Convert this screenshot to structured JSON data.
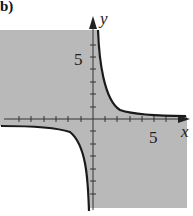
{
  "panel_label": "b)",
  "axes": {
    "x_label": "x",
    "y_label": "y",
    "x_tick_label": "5",
    "y_tick_label": "5"
  },
  "colors": {
    "shade": "#b9b9b9",
    "curve": "#1a1a1a",
    "axis": "#333333",
    "background": "#ffffff"
  },
  "graph": {
    "curve": "y = 1/x",
    "shaded_region": "xy <= 1 (between branches of hyperbola)",
    "x_range": [
      -7.5,
      7.5
    ],
    "y_range": [
      -7.5,
      7.5
    ]
  }
}
